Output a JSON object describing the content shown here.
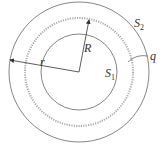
{
  "diagram": {
    "labels": {
      "outer_surface": "S",
      "outer_surface_sub": "2",
      "inner_surface": "S",
      "inner_surface_sub": "1",
      "charge": "q",
      "radius_small": "R",
      "radius_large": "r"
    },
    "colors": {
      "line": "#555555",
      "dotted_ring": "#999999",
      "background": "#ffffff"
    }
  }
}
